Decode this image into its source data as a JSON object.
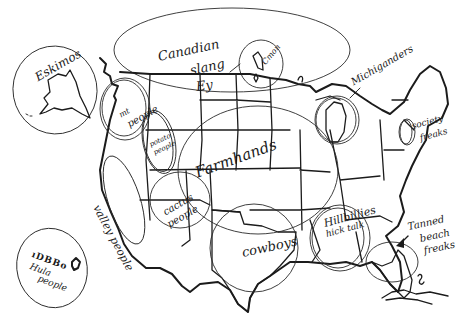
{
  "map": {
    "subject": "hand-drawn mental map of the United States with stereotype labels",
    "ink_color": "#1b1b1b",
    "background": "#ffffff"
  },
  "labels": {
    "eskimos": "Eskimos",
    "canadian_slang": [
      "Canadian",
      "slang",
      "Ey"
    ],
    "canada_island_note": "Cmon",
    "michiganders": "Michiganders",
    "society_freaks": [
      "society",
      "freaks"
    ],
    "mt_people": [
      "mt",
      "people"
    ],
    "potato_people": [
      "potato",
      "people"
    ],
    "farmhands": "Farmhands",
    "valley_people": "valley people",
    "cactus_people": [
      "cactus",
      "people"
    ],
    "cowboys": "cowboys",
    "hillbillies": [
      "Hillbillies",
      "hick talk"
    ],
    "tanned_beach_freaks": [
      "Tanned",
      "beach",
      "freaks"
    ],
    "hawaii": [
      "Hula",
      "people"
    ]
  }
}
